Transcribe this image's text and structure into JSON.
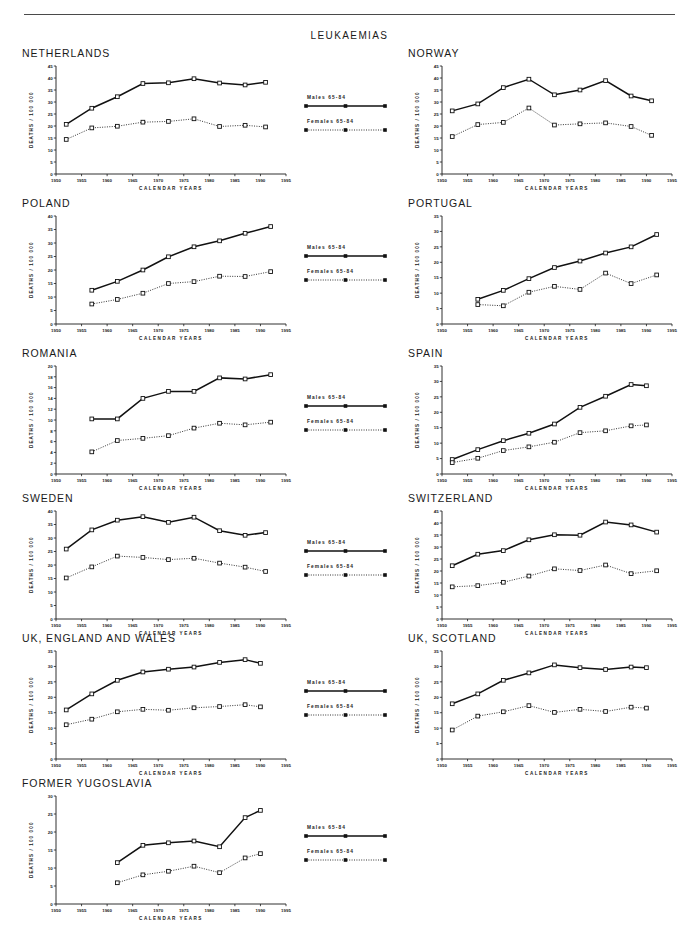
{
  "figure": {
    "title": "LEUKAEMIAS",
    "axis_labels": {
      "y": "DEATHS / 100 000",
      "x": "CALENDAR  YEARS"
    },
    "legend": {
      "males": "Males  65-84",
      "females": "Females  65-84"
    },
    "colors": {
      "males": "#111111",
      "females": "#222222",
      "axis": "#1a1a1a",
      "rule": "#4a4a4a"
    }
  },
  "chart_data": [
    {
      "type": "line",
      "title": "NETHERLANDS",
      "xlabel": "CALENDAR  YEARS",
      "ylabel": "DEATHS / 100 000",
      "xlim": [
        1950,
        1995
      ],
      "ylim": [
        0,
        45
      ],
      "xticks": [
        1950,
        1955,
        1960,
        1965,
        1970,
        1975,
        1980,
        1985,
        1990,
        1995
      ],
      "yticks": [
        0,
        5,
        10,
        15,
        20,
        25,
        30,
        35,
        40,
        45
      ],
      "grid": false,
      "legend_position": "center-gutter",
      "x": [
        1952,
        1957,
        1962,
        1967,
        1972,
        1977,
        1982,
        1987,
        1991
      ],
      "series": [
        {
          "name": "Males  65-84",
          "style": "solid",
          "values": [
            20.7,
            27.4,
            32.2,
            37.7,
            38.0,
            39.7,
            37.9,
            37.1,
            38.2
          ]
        },
        {
          "name": "Females  65-84",
          "style": "dotted",
          "values": [
            14.4,
            19.2,
            19.9,
            21.6,
            21.9,
            23.0,
            19.8,
            20.3,
            19.6
          ]
        }
      ]
    },
    {
      "type": "line",
      "title": "NORWAY",
      "xlabel": "CALENDAR  YEARS",
      "ylabel": "DEATHS / 100 000",
      "xlim": [
        1950,
        1995
      ],
      "ylim": [
        0,
        45
      ],
      "xticks": [
        1950,
        1955,
        1960,
        1965,
        1970,
        1975,
        1980,
        1985,
        1990,
        1995
      ],
      "yticks": [
        0,
        5,
        10,
        15,
        20,
        25,
        30,
        35,
        40,
        45
      ],
      "grid": false,
      "legend_position": "center-gutter",
      "x": [
        1952,
        1957,
        1962,
        1967,
        1972,
        1977,
        1982,
        1987,
        1991
      ],
      "series": [
        {
          "name": "Males  65-84",
          "style": "solid",
          "values": [
            26.3,
            29.2,
            36.0,
            39.5,
            33.0,
            35.0,
            38.9,
            32.5,
            30.5
          ]
        },
        {
          "name": "Females  65-84",
          "style": "dotted",
          "values": [
            15.6,
            20.6,
            21.5,
            27.5,
            20.4,
            20.9,
            21.3,
            19.8,
            16.1
          ]
        }
      ]
    },
    {
      "type": "line",
      "title": "POLAND",
      "xlabel": "CALENDAR  YEARS",
      "ylabel": "DEATHS / 100 000",
      "xlim": [
        1950,
        1995
      ],
      "ylim": [
        0,
        40
      ],
      "xticks": [
        1950,
        1955,
        1960,
        1965,
        1970,
        1975,
        1980,
        1985,
        1990,
        1995
      ],
      "yticks": [
        0,
        5,
        10,
        15,
        20,
        25,
        30,
        35,
        40
      ],
      "grid": false,
      "legend_position": "center-gutter",
      "x": [
        1957,
        1962,
        1967,
        1972,
        1977,
        1982,
        1987,
        1992
      ],
      "series": [
        {
          "name": "Males  65-84",
          "style": "solid",
          "values": [
            12.5,
            15.8,
            20.0,
            24.9,
            28.6,
            30.8,
            33.6,
            36.1
          ]
        },
        {
          "name": "Females  65-84",
          "style": "dotted",
          "values": [
            7.4,
            9.1,
            11.4,
            15.0,
            15.7,
            17.7,
            17.6,
            19.4
          ]
        }
      ]
    },
    {
      "type": "line",
      "title": "PORTUGAL",
      "xlabel": "CALENDAR  YEARS",
      "ylabel": "DEATHS / 100 000",
      "xlim": [
        1950,
        1995
      ],
      "ylim": [
        0,
        35
      ],
      "xticks": [
        1950,
        1955,
        1960,
        1965,
        1970,
        1975,
        1980,
        1985,
        1990,
        1995
      ],
      "yticks": [
        0,
        5,
        10,
        15,
        20,
        25,
        30,
        35
      ],
      "grid": false,
      "legend_position": "center-gutter",
      "x": [
        1957,
        1962,
        1967,
        1972,
        1977,
        1982,
        1987,
        1992
      ],
      "series": [
        {
          "name": "Males  65-84",
          "style": "solid",
          "values": [
            8.0,
            10.9,
            14.7,
            18.3,
            20.4,
            23.0,
            25.0,
            29.0
          ]
        },
        {
          "name": "Females  65-84",
          "style": "dotted",
          "values": [
            6.3,
            5.9,
            10.3,
            12.2,
            11.2,
            16.5,
            13.1,
            15.9
          ]
        }
      ]
    },
    {
      "type": "line",
      "title": "ROMANIA",
      "xlabel": "CALENDAR  YEARS",
      "ylabel": "DEATHS / 100 000",
      "xlim": [
        1950,
        1995
      ],
      "ylim": [
        0,
        20
      ],
      "xticks": [
        1950,
        1955,
        1960,
        1965,
        1970,
        1975,
        1980,
        1985,
        1990,
        1995
      ],
      "yticks": [
        0,
        2,
        4,
        6,
        8,
        10,
        12,
        14,
        16,
        18,
        20
      ],
      "grid": false,
      "legend_position": "center-gutter",
      "x": [
        1957,
        1962,
        1967,
        1972,
        1977,
        1982,
        1987,
        1992
      ],
      "series": [
        {
          "name": "Males  65-84",
          "style": "solid",
          "values": [
            10.2,
            10.2,
            14.0,
            15.3,
            15.3,
            17.8,
            17.6,
            18.4
          ]
        },
        {
          "name": "Females  65-84",
          "style": "dotted",
          "values": [
            4.1,
            6.2,
            6.6,
            7.1,
            8.5,
            9.4,
            9.1,
            9.6
          ]
        }
      ]
    },
    {
      "type": "line",
      "title": "SPAIN",
      "xlabel": "CALENDAR  YEARS",
      "ylabel": "DEATHS / 100 000",
      "xlim": [
        1950,
        1995
      ],
      "ylim": [
        0,
        35
      ],
      "xticks": [
        1950,
        1955,
        1960,
        1965,
        1970,
        1975,
        1980,
        1985,
        1990,
        1995
      ],
      "yticks": [
        0,
        5,
        10,
        15,
        20,
        25,
        30,
        35
      ],
      "grid": false,
      "legend_position": "center-gutter",
      "x": [
        1952,
        1957,
        1962,
        1967,
        1972,
        1977,
        1982,
        1987,
        1990
      ],
      "series": [
        {
          "name": "Males  65-84",
          "style": "solid",
          "values": [
            4.7,
            7.9,
            10.8,
            13.2,
            16.2,
            21.6,
            25.2,
            29.0,
            28.6
          ]
        },
        {
          "name": "Females  65-84",
          "style": "dotted",
          "values": [
            3.7,
            5.1,
            7.6,
            8.8,
            10.3,
            13.4,
            14.0,
            15.6,
            15.9
          ]
        }
      ]
    },
    {
      "type": "line",
      "title": "SWEDEN",
      "xlabel": "CALENDAR  YEARS",
      "ylabel": "DEATHS / 100 000",
      "xlim": [
        1950,
        1995
      ],
      "ylim": [
        0,
        40
      ],
      "xticks": [
        1950,
        1955,
        1960,
        1965,
        1970,
        1975,
        1980,
        1985,
        1990,
        1995
      ],
      "yticks": [
        0,
        5,
        10,
        15,
        20,
        25,
        30,
        35,
        40
      ],
      "grid": false,
      "legend_position": "center-gutter",
      "x": [
        1952,
        1957,
        1962,
        1967,
        1972,
        1977,
        1982,
        1987,
        1991
      ],
      "series": [
        {
          "name": "Males  65-84",
          "style": "solid",
          "values": [
            25.9,
            33.0,
            36.6,
            37.9,
            35.8,
            37.7,
            32.7,
            31.0,
            32.0
          ]
        },
        {
          "name": "Females  65-84",
          "style": "dotted",
          "values": [
            15.2,
            19.3,
            23.3,
            22.8,
            22.0,
            22.5,
            20.7,
            19.2,
            17.6
          ]
        }
      ]
    },
    {
      "type": "line",
      "title": "SWITZERLAND",
      "xlabel": "CALENDAR  YEARS",
      "ylabel": "DEATHS / 100 000",
      "xlim": [
        1950,
        1995
      ],
      "ylim": [
        0,
        45
      ],
      "xticks": [
        1950,
        1955,
        1960,
        1965,
        1970,
        1975,
        1980,
        1985,
        1990,
        1995
      ],
      "yticks": [
        0,
        5,
        10,
        15,
        20,
        25,
        30,
        35,
        40,
        45
      ],
      "grid": false,
      "legend_position": "center-gutter",
      "x": [
        1952,
        1957,
        1962,
        1967,
        1972,
        1977,
        1982,
        1987,
        1992
      ],
      "series": [
        {
          "name": "Males  65-84",
          "style": "solid",
          "values": [
            22.2,
            27.0,
            28.5,
            33.0,
            35.1,
            34.9,
            40.4,
            39.2,
            36.2
          ]
        },
        {
          "name": "Females  65-84",
          "style": "dotted",
          "values": [
            13.4,
            13.9,
            15.3,
            17.9,
            20.9,
            20.2,
            22.5,
            18.9,
            20.1
          ]
        }
      ]
    },
    {
      "type": "line",
      "title": "UK, ENGLAND AND WALES",
      "xlabel": "CALENDAR  YEARS",
      "ylabel": "DEATHS / 100 000",
      "xlim": [
        1950,
        1995
      ],
      "ylim": [
        0,
        35
      ],
      "xticks": [
        1950,
        1955,
        1960,
        1965,
        1970,
        1975,
        1980,
        1985,
        1990,
        1995
      ],
      "yticks": [
        0,
        5,
        10,
        15,
        20,
        25,
        30,
        35
      ],
      "grid": false,
      "legend_position": "center-gutter",
      "x": [
        1952,
        1957,
        1962,
        1967,
        1972,
        1977,
        1982,
        1987,
        1990
      ],
      "series": [
        {
          "name": "Males  65-84",
          "style": "solid",
          "values": [
            15.9,
            21.1,
            25.5,
            28.2,
            29.1,
            29.8,
            31.3,
            32.2,
            31.0
          ]
        },
        {
          "name": "Females  65-84",
          "style": "dotted",
          "values": [
            11.1,
            12.9,
            15.3,
            16.1,
            15.8,
            16.6,
            17.0,
            17.6,
            16.9
          ]
        }
      ]
    },
    {
      "type": "line",
      "title": "UK, SCOTLAND",
      "xlabel": "CALENDAR  YEARS",
      "ylabel": "DEATHS / 100 000",
      "xlim": [
        1950,
        1995
      ],
      "ylim": [
        0,
        35
      ],
      "xticks": [
        1950,
        1955,
        1960,
        1965,
        1970,
        1975,
        1980,
        1985,
        1990,
        1995
      ],
      "yticks": [
        0,
        5,
        10,
        15,
        20,
        25,
        30,
        35
      ],
      "grid": false,
      "legend_position": "center-gutter",
      "x": [
        1952,
        1957,
        1962,
        1967,
        1972,
        1977,
        1982,
        1987,
        1990
      ],
      "series": [
        {
          "name": "Males  65-84",
          "style": "solid",
          "values": [
            17.9,
            21.1,
            25.5,
            27.9,
            30.5,
            29.6,
            29.0,
            29.8,
            29.6
          ]
        },
        {
          "name": "Females  65-84",
          "style": "dotted",
          "values": [
            9.4,
            13.9,
            15.3,
            17.3,
            15.1,
            16.1,
            15.4,
            16.8,
            16.5
          ]
        }
      ]
    },
    {
      "type": "line",
      "title": "FORMER YUGOSLAVIA",
      "xlabel": "CALENDAR  YEARS",
      "ylabel": "DEATHS / 100 000",
      "xlim": [
        1950,
        1995
      ],
      "ylim": [
        0,
        30
      ],
      "xticks": [
        1950,
        1955,
        1960,
        1965,
        1970,
        1975,
        1980,
        1985,
        1990,
        1995
      ],
      "yticks": [
        0,
        5,
        10,
        15,
        20,
        25,
        30
      ],
      "grid": false,
      "legend_position": "center-gutter",
      "x": [
        1962,
        1967,
        1972,
        1977,
        1982,
        1987,
        1990
      ],
      "series": [
        {
          "name": "Males  65-84",
          "style": "solid",
          "values": [
            11.5,
            16.3,
            17.0,
            17.5,
            15.9,
            24.0,
            26.0
          ]
        },
        {
          "name": "Females  65-84",
          "style": "dotted",
          "values": [
            5.9,
            8.1,
            9.1,
            10.5,
            8.7,
            12.8,
            14.0
          ]
        }
      ]
    }
  ],
  "panel_layout": [
    {
      "index": 0,
      "left": 22,
      "top": 47,
      "plot_w": 230,
      "plot_h": 108
    },
    {
      "index": 1,
      "left": 408,
      "top": 47,
      "plot_w": 230,
      "plot_h": 108
    },
    {
      "index": 2,
      "left": 22,
      "top": 197,
      "plot_w": 230,
      "plot_h": 108
    },
    {
      "index": 3,
      "left": 408,
      "top": 197,
      "plot_w": 230,
      "plot_h": 108
    },
    {
      "index": 4,
      "left": 22,
      "top": 347,
      "plot_w": 230,
      "plot_h": 108
    },
    {
      "index": 5,
      "left": 408,
      "top": 347,
      "plot_w": 230,
      "plot_h": 108
    },
    {
      "index": 6,
      "left": 22,
      "top": 492,
      "plot_w": 230,
      "plot_h": 108
    },
    {
      "index": 7,
      "left": 408,
      "top": 492,
      "plot_w": 230,
      "plot_h": 108
    },
    {
      "index": 8,
      "left": 22,
      "top": 632,
      "plot_w": 230,
      "plot_h": 108
    },
    {
      "index": 9,
      "left": 408,
      "top": 632,
      "plot_w": 230,
      "plot_h": 108
    },
    {
      "index": 10,
      "left": 22,
      "top": 777,
      "plot_w": 230,
      "plot_h": 108
    }
  ],
  "legend_layout": [
    {
      "top": 95
    },
    {
      "top": 245
    },
    {
      "top": 395
    },
    {
      "top": 540
    },
    {
      "top": 680
    },
    {
      "top": 825
    }
  ]
}
